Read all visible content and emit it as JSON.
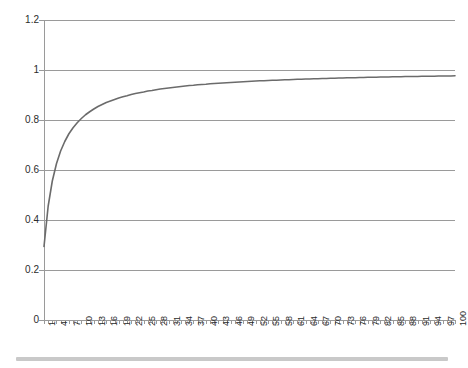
{
  "chart_data": {
    "type": "line",
    "title": "",
    "subtitle": "",
    "xlabel": "",
    "ylabel": "",
    "xlim": [
      1,
      100
    ],
    "ylim": [
      0,
      1.2
    ],
    "grid": true,
    "legend": null,
    "legend_position": "none",
    "y_ticks": [
      "0",
      "0.2",
      "0.4",
      "0.6",
      "0.8",
      "1",
      "1.2"
    ],
    "y_tick_values": [
      0,
      0.2,
      0.4,
      0.6,
      0.8,
      1,
      1.2
    ],
    "x_tick_labels": [
      "1",
      "4",
      "7",
      "10",
      "13",
      "16",
      "19",
      "22",
      "25",
      "28",
      "31",
      "34",
      "37",
      "40",
      "43",
      "46",
      "49",
      "52",
      "55",
      "58",
      "61",
      "64",
      "67",
      "70",
      "73",
      "76",
      "79",
      "82",
      "85",
      "88",
      "91",
      "94",
      "97",
      "100"
    ],
    "x_label_step": 3,
    "series": [
      {
        "name": "curve",
        "color": "#6b6b6b",
        "x": [
          1,
          2,
          3,
          4,
          5,
          6,
          7,
          8,
          9,
          10,
          11,
          12,
          13,
          14,
          15,
          16,
          17,
          18,
          19,
          20,
          21,
          22,
          23,
          24,
          25,
          26,
          27,
          28,
          29,
          30,
          31,
          32,
          33,
          34,
          35,
          36,
          37,
          38,
          39,
          40,
          41,
          42,
          43,
          44,
          45,
          46,
          47,
          48,
          49,
          50,
          51,
          52,
          53,
          54,
          55,
          56,
          57,
          58,
          59,
          60,
          61,
          62,
          63,
          64,
          65,
          66,
          67,
          68,
          69,
          70,
          71,
          72,
          73,
          74,
          75,
          76,
          77,
          78,
          79,
          80,
          81,
          82,
          83,
          84,
          85,
          86,
          87,
          88,
          89,
          90,
          91,
          92,
          93,
          94,
          95,
          96,
          97,
          98,
          99,
          100
        ],
        "values": [
          0.294,
          0.455,
          0.556,
          0.625,
          0.676,
          0.714,
          0.745,
          0.769,
          0.789,
          0.806,
          0.821,
          0.833,
          0.844,
          0.854,
          0.862,
          0.87,
          0.876,
          0.882,
          0.888,
          0.893,
          0.897,
          0.902,
          0.906,
          0.909,
          0.912,
          0.916,
          0.918,
          0.921,
          0.924,
          0.926,
          0.928,
          0.93,
          0.932,
          0.934,
          0.936,
          0.938,
          0.939,
          0.941,
          0.942,
          0.943,
          0.945,
          0.946,
          0.947,
          0.948,
          0.949,
          0.95,
          0.951,
          0.952,
          0.953,
          0.954,
          0.955,
          0.956,
          0.957,
          0.957,
          0.958,
          0.959,
          0.959,
          0.96,
          0.961,
          0.961,
          0.962,
          0.963,
          0.963,
          0.964,
          0.964,
          0.965,
          0.965,
          0.966,
          0.966,
          0.967,
          0.967,
          0.968,
          0.968,
          0.969,
          0.969,
          0.969,
          0.97,
          0.97,
          0.971,
          0.971,
          0.971,
          0.972,
          0.972,
          0.972,
          0.973,
          0.973,
          0.973,
          0.974,
          0.974,
          0.974,
          0.974,
          0.975,
          0.975,
          0.975,
          0.975,
          0.976,
          0.976,
          0.976,
          0.976,
          0.977
        ]
      }
    ]
  },
  "colors": {
    "series": "#6b6b6b",
    "grid": "#9a9a9a",
    "text": "#2b2b2b",
    "bottom_bar": "#c9c9c9",
    "background": "#ffffff"
  }
}
